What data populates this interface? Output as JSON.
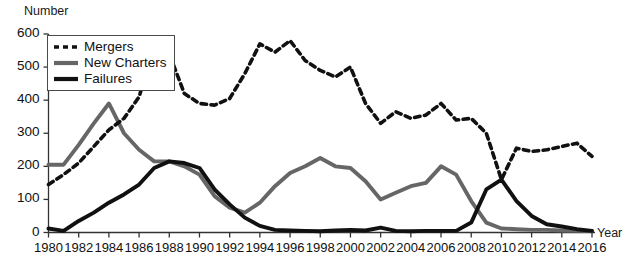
{
  "chart_data": {
    "type": "line",
    "title": "",
    "xlabel": "Year",
    "ylabel": "Number",
    "xlim": [
      1980,
      2016
    ],
    "ylim": [
      0,
      600
    ],
    "ytick_labels": [
      "0",
      "100",
      "200",
      "300",
      "400",
      "500",
      "600"
    ],
    "yticks": [
      0,
      100,
      200,
      300,
      400,
      500,
      600
    ],
    "xtick_labels": [
      "1980",
      "1982",
      "1984",
      "1986",
      "1988",
      "1990",
      "1992",
      "1994",
      "1996",
      "1998",
      "2000",
      "2002",
      "2004",
      "2006",
      "2008",
      "2010",
      "2012",
      "2014",
      "2016"
    ],
    "xticks": [
      1980,
      1982,
      1984,
      1986,
      1988,
      1990,
      1992,
      1994,
      1996,
      1998,
      2000,
      2002,
      2004,
      2006,
      2008,
      2010,
      2012,
      2014,
      2016
    ],
    "grid": false,
    "legend_position": "upper-left",
    "x": [
      1980,
      1981,
      1982,
      1983,
      1984,
      1985,
      1986,
      1987,
      1988,
      1989,
      1990,
      1991,
      1992,
      1993,
      1994,
      1995,
      1996,
      1997,
      1998,
      1999,
      2000,
      2001,
      2002,
      2003,
      2004,
      2005,
      2006,
      2007,
      2008,
      2009,
      2010,
      2011,
      2012,
      2013,
      2014,
      2015,
      2016
    ],
    "series": [
      {
        "name": "Mergers",
        "color": "#111111",
        "style": "dashed",
        "values": [
          145,
          175,
          210,
          260,
          310,
          345,
          410,
          565,
          540,
          420,
          390,
          385,
          405,
          480,
          570,
          545,
          580,
          520,
          490,
          470,
          500,
          390,
          330,
          365,
          345,
          355,
          390,
          340,
          345,
          300,
          160,
          255,
          245,
          250,
          260,
          270,
          230
        ]
      },
      {
        "name": "New Charters",
        "color": "#666666",
        "style": "solid",
        "values": [
          205,
          205,
          265,
          330,
          390,
          300,
          250,
          215,
          215,
          200,
          175,
          110,
          75,
          60,
          90,
          140,
          180,
          200,
          225,
          200,
          195,
          155,
          100,
          120,
          140,
          150,
          200,
          175,
          95,
          30,
          12,
          10,
          8,
          8,
          6,
          5,
          5
        ]
      },
      {
        "name": "Failures",
        "color": "#111111",
        "style": "solid",
        "values": [
          12,
          5,
          35,
          60,
          90,
          115,
          145,
          195,
          215,
          210,
          195,
          130,
          85,
          45,
          20,
          8,
          6,
          5,
          4,
          6,
          8,
          6,
          15,
          5,
          4,
          5,
          5,
          5,
          30,
          130,
          160,
          95,
          50,
          25,
          18,
          10,
          5
        ]
      }
    ]
  },
  "axis": {
    "ylabel": "Number",
    "xlabel": "Year"
  },
  "legend": {
    "entries": [
      {
        "label": "Mergers",
        "swatch": "dashed-line-swatch"
      },
      {
        "label": "New Charters",
        "swatch": "gray-line-swatch"
      },
      {
        "label": "Failures",
        "swatch": "black-line-swatch"
      }
    ]
  }
}
